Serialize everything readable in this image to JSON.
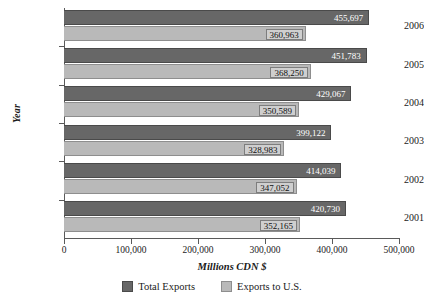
{
  "chart_data": {
    "type": "bar",
    "orientation": "horizontal",
    "title": "",
    "xlabel": "Millions CDN $",
    "ylabel": "Year",
    "xlim": [
      0,
      500000
    ],
    "grid": false,
    "legend_position": "bottom",
    "categories": [
      "2006",
      "2005",
      "2004",
      "2003",
      "2002",
      "2001"
    ],
    "x_ticks": [
      {
        "value": 0,
        "label": "0"
      },
      {
        "value": 100000,
        "label": "100,000"
      },
      {
        "value": 200000,
        "label": "200,000"
      },
      {
        "value": 300000,
        "label": "300,000"
      },
      {
        "value": 400000,
        "label": "400,000"
      },
      {
        "value": 500000,
        "label": "500,000"
      }
    ],
    "series": [
      {
        "name": "Total Exports",
        "color": "#676767",
        "values": [
          455697,
          451783,
          429067,
          399122,
          414039,
          420730
        ],
        "labels": [
          "455,697",
          "451,783",
          "429,067",
          "399,122",
          "414,039",
          "420,730"
        ]
      },
      {
        "name": "Exports to U.S.",
        "color": "#b9b9b9",
        "values": [
          360963,
          368250,
          350589,
          328983,
          347052,
          352165
        ],
        "labels": [
          "360,963",
          "368,250",
          "350,589",
          "328,983",
          "347,052",
          "352,165"
        ]
      }
    ]
  },
  "legend": {
    "items": [
      {
        "label": "Total Exports"
      },
      {
        "label": "Exports to U.S."
      }
    ]
  }
}
